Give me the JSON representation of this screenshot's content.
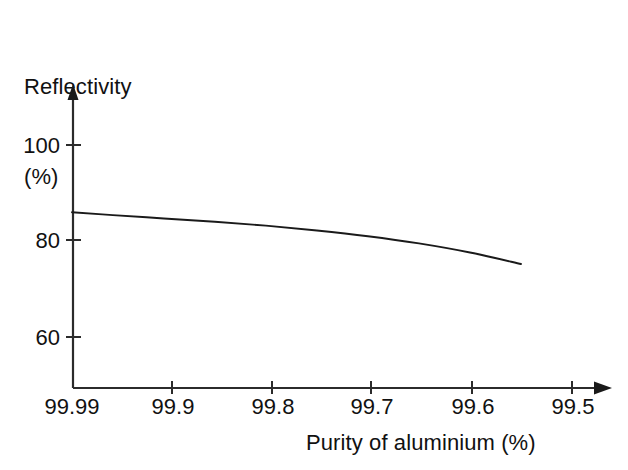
{
  "figure": {
    "background_color": "#ffffff",
    "line_color": "#1a1a1a",
    "axis_color": "#2b2b2b"
  },
  "axes": {
    "y_title_line1": "Reflectivity",
    "y_title_line2": "(%)",
    "x_title": "Purity of aluminium (%)"
  },
  "chart_data": {
    "type": "line",
    "title": "",
    "subtitle": "",
    "xlabel": "Purity of aluminium (%)",
    "ylabel": "Reflectivity (%)",
    "x_tick_labels": [
      "99.99",
      "99.9",
      "99.8",
      "99.7",
      "99.6",
      "99.5"
    ],
    "x_tick_values": [
      99.99,
      99.9,
      99.8,
      99.7,
      99.6,
      99.5
    ],
    "y_tick_labels": [
      "100",
      "80",
      "60"
    ],
    "y_tick_values": [
      100,
      80,
      60
    ],
    "xlim": [
      99.99,
      99.46
    ],
    "ylim": [
      48,
      109
    ],
    "x_axis_direction": "decreasing",
    "grid": false,
    "legend": false,
    "legend_position": "none",
    "annotations": [],
    "series": [
      {
        "name": "Reflectivity",
        "x": [
          99.99,
          99.95,
          99.9,
          99.85,
          99.8,
          99.75,
          99.7,
          99.65,
          99.6,
          99.55
        ],
        "values": [
          86.0,
          85.4,
          84.7,
          84.0,
          83.2,
          82.2,
          81.0,
          79.5,
          77.6,
          75.2
        ]
      }
    ]
  },
  "geometry": {
    "x_axis_y_px": 388,
    "y_axis_x_px": 73,
    "x_tick_px": [
      72,
      172,
      272,
      371,
      472,
      572
    ],
    "y_tick_px": [
      145,
      240,
      337
    ],
    "curve_start_px": [
      73,
      213
    ],
    "curve_end_px": [
      525,
      266
    ]
  }
}
